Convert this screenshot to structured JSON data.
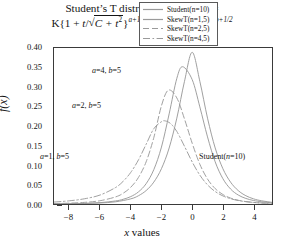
{
  "title": {
    "line1_prefix": "Student’s T distribution ",
    "line1_func": "f",
    "line1_args": "(t, a, b)",
    "line1_suffix": " =",
    "line2_full": "K{1 + t/√(C + t²)}^{a+1/2} {1 − t/√(C + t²)}^{b+1/2}",
    "k": "K{1 + ",
    "t1": "t",
    "slash": "/",
    "rad1": "C + t",
    "exp1": "a+1/2",
    "mid": "{1 − ",
    "t2": "t",
    "rad2": "C + t",
    "exp2": "b+1/2"
  },
  "axes": {
    "y_label": "f(x)",
    "y_label_f": "f",
    "y_label_x": "(x)",
    "x_label_prefix": "x",
    "x_label_suffix": " values",
    "y_ticks": [
      "0.40",
      "0.35",
      "0.30",
      "0.25",
      "0.20",
      "0.15",
      "0.10",
      "0.05",
      "0.00"
    ],
    "x_ticks": [
      "−8",
      "−6",
      "−4",
      "−2",
      "0",
      "2",
      "4"
    ]
  },
  "legend": {
    "items": [
      {
        "label": "Student(n=10)",
        "style": "solid",
        "color": "#9a9a9a"
      },
      {
        "label": "SkewT(n=1,5)",
        "style": "solid",
        "color": "#9a9a9a"
      },
      {
        "label": "SkewT(n=2,5)",
        "style": "dashed",
        "color": "#9a9a9a"
      },
      {
        "label": "SkewT(n=4,5)",
        "style": "dashdot",
        "color": "#9a9a9a"
      }
    ]
  },
  "annotations": [
    {
      "text": "a=4, b=5",
      "left": "92px",
      "top": "66px"
    },
    {
      "text": "a=2, b=5",
      "left": "72px",
      "top": "101px"
    },
    {
      "text": "a=1, b=5",
      "left": "40px",
      "top": "152px"
    },
    {
      "text": "Student(n=10)",
      "left": "199px",
      "top": "152px"
    }
  ],
  "chart_data": {
    "type": "line",
    "xlabel": "x values",
    "ylabel": "f(x)",
    "xlim": [
      -9,
      5.2
    ],
    "ylim": [
      0.0,
      0.4
    ],
    "xticks": [
      -8,
      -6,
      -4,
      -2,
      0,
      2,
      4
    ],
    "yticks": [
      0.0,
      0.05,
      0.1,
      0.15,
      0.2,
      0.25,
      0.3,
      0.35,
      0.4
    ],
    "grid": false,
    "legend_position": "top-right",
    "series": [
      {
        "name": "Student(n=10)",
        "style": "solid",
        "color": "#9a9a9a",
        "peak_x": 0.0,
        "peak_y": 0.389,
        "annotation": "Student(n=10)",
        "x": [
          -9,
          -8,
          -7,
          -6,
          -5,
          -4,
          -3.5,
          -3,
          -2.5,
          -2,
          -1.5,
          -1,
          -0.5,
          0,
          0.5,
          1,
          1.5,
          2,
          2.5,
          3,
          3.5,
          4,
          4.5,
          5.2
        ],
        "y": [
          0.0004,
          0.0007,
          0.0013,
          0.0026,
          0.0056,
          0.0132,
          0.0212,
          0.0344,
          0.0561,
          0.0906,
          0.1436,
          0.2201,
          0.3146,
          0.389,
          0.3146,
          0.2201,
          0.1436,
          0.0906,
          0.0561,
          0.0344,
          0.0212,
          0.0132,
          0.0084,
          0.0043
        ]
      },
      {
        "name": "SkewT(n=1,5)",
        "style": "solid",
        "color": "#9a9a9a",
        "peak_x": -0.62,
        "peak_y": 0.352,
        "annotation": "a=4, b=5",
        "x": [
          -9,
          -8,
          -7,
          -6,
          -5,
          -4.5,
          -4,
          -3.5,
          -3,
          -2.5,
          -2,
          -1.5,
          -1,
          -0.62,
          0,
          0.5,
          1,
          1.5,
          2,
          2.5,
          3,
          3.5,
          4,
          4.5,
          5.2
        ],
        "y": [
          0.0005,
          0.0009,
          0.0017,
          0.0035,
          0.0078,
          0.012,
          0.019,
          0.031,
          0.052,
          0.088,
          0.146,
          0.231,
          0.322,
          0.352,
          0.319,
          0.249,
          0.172,
          0.108,
          0.065,
          0.0385,
          0.023,
          0.0142,
          0.009,
          0.0058,
          0.003
        ]
      },
      {
        "name": "SkewT(n=2,5)",
        "style": "dashed",
        "color": "#9a9a9a",
        "peak_x": -1.55,
        "peak_y": 0.292,
        "annotation": "a=2, b=5",
        "x": [
          -9,
          -8,
          -7,
          -6,
          -5,
          -4.5,
          -4,
          -3.5,
          -3,
          -2.5,
          -2,
          -1.55,
          -1,
          -0.5,
          0,
          0.5,
          1,
          1.5,
          2,
          2.5,
          3,
          3.5,
          4,
          4.5,
          5.2
        ],
        "y": [
          0.0012,
          0.0022,
          0.0042,
          0.0084,
          0.018,
          0.0275,
          0.043,
          0.068,
          0.108,
          0.17,
          0.252,
          0.292,
          0.272,
          0.218,
          0.156,
          0.102,
          0.064,
          0.0395,
          0.0245,
          0.0152,
          0.0096,
          0.0062,
          0.004,
          0.0026,
          0.0014
        ]
      },
      {
        "name": "SkewT(n=4,5)",
        "style": "dashdot",
        "color": "#9a9a9a",
        "peak_x": -1.75,
        "peak_y": 0.213,
        "annotation": "a=1, b=5",
        "x": [
          -9,
          -8,
          -7,
          -6,
          -5,
          -4.5,
          -4,
          -3.5,
          -3,
          -2.5,
          -2,
          -1.75,
          -1.4,
          -1,
          -0.5,
          0,
          0.5,
          1,
          1.5,
          2,
          2.5,
          3,
          3.5,
          4,
          4.5,
          5.2
        ],
        "y": [
          0.005,
          0.0082,
          0.0135,
          0.023,
          0.042,
          0.058,
          0.081,
          0.113,
          0.153,
          0.193,
          0.211,
          0.213,
          0.206,
          0.186,
          0.148,
          0.108,
          0.074,
          0.049,
          0.032,
          0.0208,
          0.0136,
          0.009,
          0.006,
          0.0041,
          0.0028,
          0.0016
        ]
      }
    ]
  }
}
